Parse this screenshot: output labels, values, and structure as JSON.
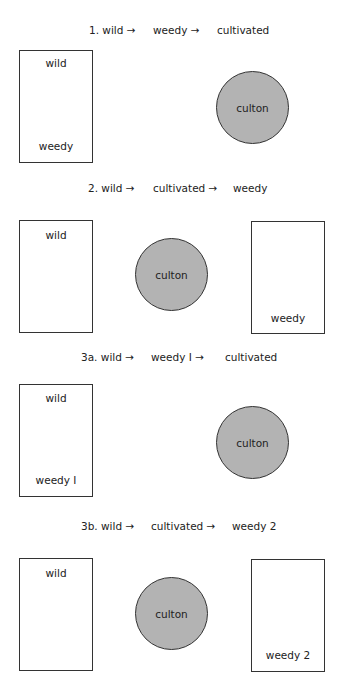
{
  "panels": [
    {
      "title": {
        "step1": "1. wild →",
        "step2": "weedy →",
        "step3": "cultivated"
      },
      "left_box": {
        "top_label": "wild",
        "bottom_label": "weedy"
      },
      "circle": {
        "label": "culton"
      }
    },
    {
      "title": {
        "step1": "2. wild →",
        "step2": "cultivated →",
        "step3": "weedy"
      },
      "left_box": {
        "top_label": "wild"
      },
      "circle": {
        "label": "culton"
      },
      "right_box": {
        "bottom_label": "weedy"
      }
    },
    {
      "title": {
        "step1": "3a. wild →",
        "step2": "weedy I →",
        "step3": "cultivated"
      },
      "left_box": {
        "top_label": "wild",
        "bottom_label": "weedy I"
      },
      "circle": {
        "label": "culton"
      }
    },
    {
      "title": {
        "step1": "3b. wild →",
        "step2": "cultivated →",
        "step3": "weedy 2"
      },
      "left_box": {
        "top_label": "wild"
      },
      "circle": {
        "label": "culton"
      },
      "right_box": {
        "bottom_label": "weedy 2"
      }
    }
  ],
  "colors": {
    "culton_fill": "#b3b3b3",
    "outline": "#333333"
  }
}
